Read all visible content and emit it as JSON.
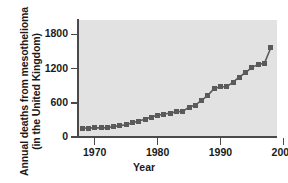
{
  "chart_data": {
    "type": "scatter",
    "title": "",
    "xlabel": "Year",
    "ylabel_line1": "Annual deaths from mesothelioma",
    "ylabel_line2": "(in the United Kingdom)",
    "xlim": [
      1967.5,
      1999.0
    ],
    "ylim": [
      0,
      2050
    ],
    "grid": false,
    "legend": "none",
    "marker_color": "#5a5a5a",
    "plot_background": "#e2e2e2",
    "axis_color": "#4a4a4a",
    "xticks": [
      1970,
      1980,
      1990,
      2000
    ],
    "xticklabels": [
      "1970",
      "1980",
      "1990",
      "2000"
    ],
    "yticks": [
      0,
      600,
      1200,
      1800
    ],
    "yticklabels": [
      "0",
      "600",
      "1200",
      "1800"
    ],
    "x": [
      1968,
      1969,
      1970,
      1971,
      1972,
      1973,
      1974,
      1975,
      1976,
      1977,
      1978,
      1979,
      1980,
      1981,
      1982,
      1983,
      1984,
      1985,
      1986,
      1987,
      1988,
      1989,
      1990,
      1991,
      1992,
      1993,
      1994,
      1995,
      1996,
      1997,
      1998
    ],
    "values": [
      153,
      157,
      160,
      160,
      165,
      185,
      200,
      215,
      250,
      280,
      310,
      350,
      380,
      400,
      420,
      440,
      450,
      520,
      560,
      640,
      730,
      850,
      880,
      880,
      960,
      1050,
      1130,
      1220,
      1270,
      1290,
      1560
    ],
    "series": [
      {
        "name": "Annual deaths from mesothelioma",
        "values": [
          153,
          157,
          160,
          160,
          165,
          185,
          200,
          215,
          250,
          280,
          310,
          350,
          380,
          400,
          420,
          440,
          450,
          520,
          560,
          640,
          730,
          850,
          880,
          880,
          960,
          1050,
          1130,
          1220,
          1270,
          1290,
          1560
        ]
      }
    ]
  }
}
